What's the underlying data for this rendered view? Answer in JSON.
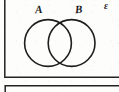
{
  "figure": {
    "type": "venn-diagram",
    "background_color": "#fdfdfc",
    "stroke_color": "#1c1c1c",
    "labels": {
      "set_a": "A",
      "set_b": "B",
      "universal_set": "ε"
    },
    "universal_rectangle": {
      "name": "universal-set-rectangle",
      "left_border_x": 4.5,
      "bottom_border_y": 77,
      "cropped_top": true,
      "cropped_right": true,
      "stroke_width": 1.4
    },
    "circles": [
      {
        "name": "set-a-circle",
        "label": "A",
        "cx": 48,
        "cy": 43,
        "r": 23.5,
        "stroke_width": 1.5
      },
      {
        "name": "set-b-circle",
        "label": "B",
        "cx": 71.5,
        "cy": 43,
        "r": 23.5,
        "stroke_width": 1.5
      }
    ],
    "secondary_rectangle": {
      "name": "secondary-figure-box",
      "left_border_x": 5,
      "top_border_y": 85.5,
      "cropped_bottom": true,
      "cropped_right": true,
      "stroke_width": 1.4
    }
  }
}
